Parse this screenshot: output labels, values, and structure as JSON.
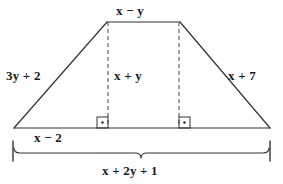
{
  "figure": {
    "type": "geometry-diagram",
    "shape": "trapezoid",
    "stroke_color": "#333333",
    "dash_color": "#555555",
    "background_color": "#ffffff",
    "text_color": "#1a1a1a"
  },
  "labels": {
    "top_side": "x − y",
    "left_side": "3y + 2",
    "right_side": "x + 7",
    "height": "x + y",
    "base_segment": "x − 2",
    "base_total": "x + 2y + 1"
  },
  "geometry": {
    "top_left_vertex": [
      107,
      22
    ],
    "top_right_vertex": [
      180,
      22
    ],
    "bottom_left_vertex": [
      14,
      128
    ],
    "bottom_right_vertex": [
      270,
      128
    ],
    "left_altitude_x": 108,
    "right_altitude_x": 179,
    "altitude_top_y": 22,
    "altitude_bottom_y": 128,
    "right_angle_box_size": 11,
    "brace_left_x": 13,
    "brace_right_x": 270,
    "brace_y": 152,
    "tick_top_y": 141,
    "tick_bottom_y": 161
  }
}
